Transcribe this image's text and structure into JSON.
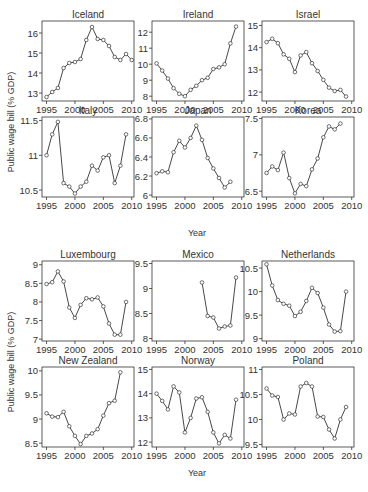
{
  "chart_data": [
    {
      "group": "top",
      "type": "line",
      "ylabel": "Public wage bill (% GDP)",
      "xlabel": "Year",
      "x_ticks": [
        1995,
        2000,
        2005,
        2010
      ],
      "panels": [
        {
          "title": "Iceland",
          "y_ticks": [
            13,
            14,
            15,
            16
          ],
          "ylim": [
            12.6,
            16.6
          ],
          "x": [
            1995,
            1996,
            1997,
            1998,
            1999,
            2000,
            2001,
            2002,
            2003,
            2004,
            2005,
            2006,
            2007,
            2008,
            2009,
            2010
          ],
          "y": [
            12.8,
            13.05,
            13.25,
            14.25,
            14.5,
            14.55,
            14.7,
            15.65,
            16.3,
            15.7,
            15.65,
            15.35,
            14.8,
            14.65,
            14.95,
            14.65
          ]
        },
        {
          "title": "Ireland",
          "y_ticks": [
            8,
            9,
            10,
            11,
            12
          ],
          "ylim": [
            7.7,
            12.7
          ],
          "x": [
            1995,
            1996,
            1997,
            1998,
            1999,
            2000,
            2001,
            2002,
            2003,
            2004,
            2005,
            2006,
            2007,
            2008,
            2009
          ],
          "y": [
            10.05,
            9.6,
            9.1,
            8.5,
            8.15,
            8.0,
            8.4,
            8.65,
            9.0,
            9.15,
            9.7,
            9.8,
            10.0,
            11.3,
            12.35
          ]
        },
        {
          "title": "Israel",
          "y_ticks": [
            12,
            13,
            14,
            15
          ],
          "ylim": [
            11.6,
            15.2
          ],
          "x": [
            1995,
            1996,
            1997,
            1998,
            1999,
            2000,
            2001,
            2002,
            2003,
            2004,
            2005,
            2006,
            2007,
            2008,
            2009
          ],
          "y": [
            14.25,
            14.4,
            14.2,
            13.7,
            13.5,
            12.9,
            13.65,
            13.8,
            13.3,
            12.95,
            12.55,
            12.2,
            12.05,
            12.1,
            11.8
          ]
        },
        {
          "title": "Italy",
          "y_ticks": [
            10.5,
            11,
            11.5
          ],
          "ylim": [
            10.4,
            11.55
          ],
          "x": [
            1995,
            1996,
            1997,
            1998,
            1999,
            2000,
            2001,
            2002,
            2003,
            2004,
            2005,
            2006,
            2007,
            2008,
            2009
          ],
          "y": [
            11.0,
            11.3,
            11.48,
            10.6,
            10.55,
            10.45,
            10.55,
            10.62,
            10.85,
            10.78,
            10.97,
            11.0,
            10.6,
            10.85,
            11.3
          ]
        },
        {
          "title": "Japan",
          "y_ticks": [
            6,
            6.2,
            6.4,
            6.6,
            6.8
          ],
          "ylim": [
            5.98,
            6.82
          ],
          "x": [
            1995,
            1996,
            1997,
            1998,
            1999,
            2000,
            2001,
            2002,
            2003,
            2004,
            2005,
            2006,
            2007,
            2008
          ],
          "y": [
            6.23,
            6.25,
            6.24,
            6.45,
            6.57,
            6.5,
            6.6,
            6.73,
            6.58,
            6.39,
            6.28,
            6.18,
            6.08,
            6.14
          ]
        },
        {
          "title": "Korea",
          "y_ticks": [
            6.5,
            7,
            7.5
          ],
          "ylim": [
            6.42,
            7.52
          ],
          "x": [
            1995,
            1996,
            1997,
            1998,
            1999,
            2000,
            2001,
            2002,
            2003,
            2004,
            2005,
            2006,
            2007,
            2008
          ],
          "y": [
            6.75,
            6.84,
            6.79,
            7.03,
            6.68,
            6.47,
            6.6,
            6.57,
            6.8,
            6.95,
            7.24,
            7.39,
            7.35,
            7.43
          ]
        }
      ]
    },
    {
      "group": "bottom",
      "type": "line",
      "ylabel": "Public wage bill (% GDP)",
      "xlabel": "Year",
      "x_ticks": [
        1995,
        2000,
        2005,
        2010
      ],
      "panels": [
        {
          "title": "Luxembourg",
          "y_ticks": [
            7,
            7.5,
            8,
            8.5,
            9
          ],
          "ylim": [
            6.95,
            9.1
          ],
          "x": [
            1995,
            1996,
            1997,
            1998,
            1999,
            2000,
            2001,
            2002,
            2003,
            2004,
            2005,
            2006,
            2007,
            2008,
            2009
          ],
          "y": [
            8.48,
            8.53,
            8.82,
            8.55,
            7.85,
            7.57,
            7.92,
            8.1,
            8.07,
            8.12,
            7.88,
            7.42,
            7.12,
            7.12,
            8.0
          ]
        },
        {
          "title": "Mexico",
          "y_ticks": [
            8,
            8.5,
            9,
            9.5
          ],
          "ylim": [
            7.95,
            9.55
          ],
          "x": [
            2003,
            2004,
            2005,
            2006,
            2007,
            2008,
            2009
          ],
          "y": [
            9.12,
            8.45,
            8.42,
            8.2,
            8.24,
            8.26,
            9.22
          ]
        },
        {
          "title": "Netherlands",
          "y_ticks": [
            9,
            9.5,
            10,
            10.5
          ],
          "ylim": [
            8.95,
            10.65
          ],
          "x": [
            1995,
            1996,
            1997,
            1998,
            1999,
            2000,
            2001,
            2002,
            2003,
            2004,
            2005,
            2006,
            2007,
            2008,
            2009
          ],
          "y": [
            10.58,
            10.13,
            9.82,
            9.74,
            9.7,
            9.48,
            9.57,
            9.8,
            10.08,
            9.97,
            9.66,
            9.3,
            9.15,
            9.16,
            10.0
          ]
        },
        {
          "title": "New Zealand",
          "y_ticks": [
            8.5,
            9,
            9.5,
            10
          ],
          "ylim": [
            8.42,
            10.08
          ],
          "x": [
            1995,
            1996,
            1997,
            1998,
            1999,
            2000,
            2001,
            2002,
            2003,
            2004,
            2005,
            2006,
            2007,
            2008
          ],
          "y": [
            9.12,
            9.05,
            9.04,
            9.15,
            8.85,
            8.65,
            8.48,
            8.65,
            8.7,
            8.79,
            9.07,
            9.33,
            9.38,
            9.97
          ]
        },
        {
          "title": "Norway",
          "y_ticks": [
            12,
            13,
            14,
            15
          ],
          "ylim": [
            11.8,
            15.1
          ],
          "x": [
            1995,
            1996,
            1997,
            1998,
            1999,
            2000,
            2001,
            2002,
            2003,
            2004,
            2005,
            2006,
            2007,
            2008,
            2009
          ],
          "y": [
            14.0,
            13.7,
            13.35,
            14.3,
            14.05,
            12.4,
            13.0,
            13.8,
            13.85,
            13.25,
            12.4,
            11.95,
            12.3,
            12.15,
            13.75
          ]
        },
        {
          "title": "Poland",
          "y_ticks": [
            9.5,
            10,
            10.5,
            11
          ],
          "ylim": [
            9.45,
            11.05
          ],
          "x": [
            1995,
            1996,
            1997,
            1998,
            1999,
            2000,
            2001,
            2002,
            2003,
            2004,
            2005,
            2006,
            2007,
            2008,
            2009
          ],
          "y": [
            10.62,
            10.48,
            10.45,
            10.0,
            10.12,
            10.1,
            10.66,
            10.73,
            10.66,
            10.06,
            10.05,
            9.8,
            9.62,
            10.0,
            10.25
          ]
        }
      ]
    }
  ],
  "labels": {
    "ylabel_top": "Public wage bill (% GDP)",
    "ylabel_bottom": "Public wage bill (% GDP)",
    "xlabel_top": "Year",
    "xlabel_bottom": "Year"
  }
}
